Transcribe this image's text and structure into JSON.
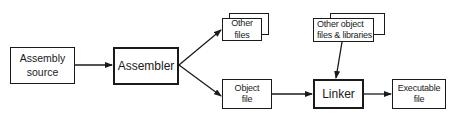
{
  "diagram": {
    "type": "flowchart",
    "nodes": [
      {
        "id": "assembly_source",
        "label_lines": [
          "Assembly",
          "source"
        ]
      },
      {
        "id": "assembler",
        "label_lines": [
          "Assembler"
        ]
      },
      {
        "id": "other_files",
        "label_lines": [
          "Other",
          "files"
        ],
        "stacked": true
      },
      {
        "id": "object_file",
        "label_lines": [
          "Object",
          "file"
        ]
      },
      {
        "id": "other_object_files",
        "label_lines": [
          "Other object",
          "files & libraries"
        ],
        "stacked": true
      },
      {
        "id": "linker",
        "label_lines": [
          "Linker"
        ]
      },
      {
        "id": "executable_file",
        "label_lines": [
          "Executable",
          "file"
        ]
      }
    ],
    "edges": [
      {
        "from": "assembly_source",
        "to": "assembler"
      },
      {
        "from": "assembler",
        "to": "other_files"
      },
      {
        "from": "assembler",
        "to": "object_file"
      },
      {
        "from": "object_file",
        "to": "linker"
      },
      {
        "from": "other_object_files",
        "to": "linker"
      },
      {
        "from": "linker",
        "to": "executable_file"
      }
    ],
    "colors": {
      "stroke": "#1a1a1a",
      "background": "#ffffff"
    }
  }
}
